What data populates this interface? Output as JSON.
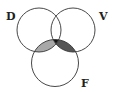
{
  "diagram": {
    "type": "venn",
    "sets": [
      {
        "id": "D",
        "label": "D",
        "cx": 39,
        "cy": 30,
        "r": 22
      },
      {
        "id": "V",
        "label": "V",
        "cx": 73,
        "cy": 30,
        "r": 22
      },
      {
        "id": "F",
        "label": "F",
        "cx": 55,
        "cy": 63,
        "r": 23.5
      }
    ],
    "shaded_regions": [
      {
        "region": "D∩F only",
        "color": "#a8a8a8"
      },
      {
        "region": "V∩F only",
        "color": "#555555"
      },
      {
        "region": "D∩V∩F",
        "color": "#111111"
      }
    ],
    "colors": {
      "stroke": "#333333",
      "background": "#ffffff"
    }
  }
}
